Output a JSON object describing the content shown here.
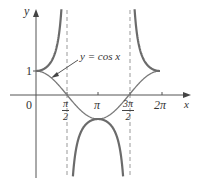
{
  "chart_data": {
    "type": "line",
    "title": "",
    "xlabel": "x",
    "ylabel": "y",
    "annotation": "y = cos x",
    "series": [
      {
        "name": "y = sec x",
        "style": "thick gray",
        "description": "secant curve with vertical asymptotes at pi/2 and 3pi/2"
      },
      {
        "name": "y = cos x",
        "style": "thin gray"
      }
    ],
    "asymptotes_x": [
      "pi/2",
      "3pi/2"
    ],
    "x_ticks": [
      "0",
      "π/2",
      "π",
      "3π/2",
      "2π"
    ],
    "y_ticks": [
      "1"
    ],
    "xlim": [
      -0.5,
      7.6
    ],
    "ylim": [
      -3.4,
      3.9
    ],
    "grid": false,
    "legend": "none"
  },
  "labels": {
    "y_axis": "y",
    "x_axis": "x",
    "origin": "0",
    "one": "1",
    "annotation": "y = cos x",
    "pi_half": {
      "num": "π",
      "den": "2"
    },
    "pi": "π",
    "three_pi_half": {
      "num": "3π",
      "den": "2"
    },
    "two_pi": "2π"
  },
  "colors": {
    "curve": "#6b6b6b",
    "axis": "#555555",
    "dash": "#888888",
    "text": "#333333"
  }
}
